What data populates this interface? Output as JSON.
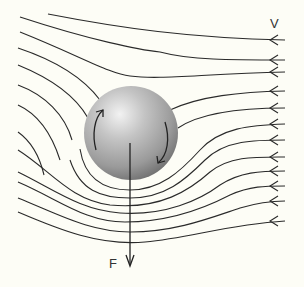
{
  "diagram": {
    "labels": {
      "velocity": "V",
      "force": "F"
    },
    "colors": {
      "background": "#fdfdf6",
      "streamline": "#2a2a2a",
      "sphere_light": "#e6e6e6",
      "sphere_mid": "#a9a9a9",
      "sphere_dark": "#6e6e6e"
    },
    "streamline_count": 13,
    "rotation": "clockwise",
    "flow_direction": "right-to-left"
  }
}
